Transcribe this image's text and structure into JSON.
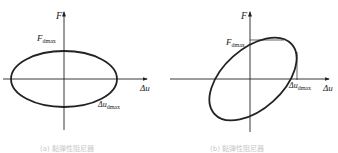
{
  "header_fragment": "图 2.2 2 型(F)",
  "panels": [
    {
      "id": "a",
      "y_axis_label": "F",
      "x_axis_label": "Δu",
      "force_label": "F",
      "force_sub": "dmax",
      "disp_label": "Δu",
      "disp_sub": "dmax",
      "loop_shape": "horizontal ellipse (in phase 90°, no stiffness)",
      "caption": "(a) 黏弹性阻尼器"
    },
    {
      "id": "b",
      "y_axis_label": "F",
      "x_axis_label": "Δu",
      "force_label": "F",
      "force_sub": "dmax",
      "disp_label": "Δu",
      "disp_sub": "dmax",
      "loop_shape": "inclined ellipse",
      "caption": "(b) 黏弹性阻尼器"
    }
  ]
}
